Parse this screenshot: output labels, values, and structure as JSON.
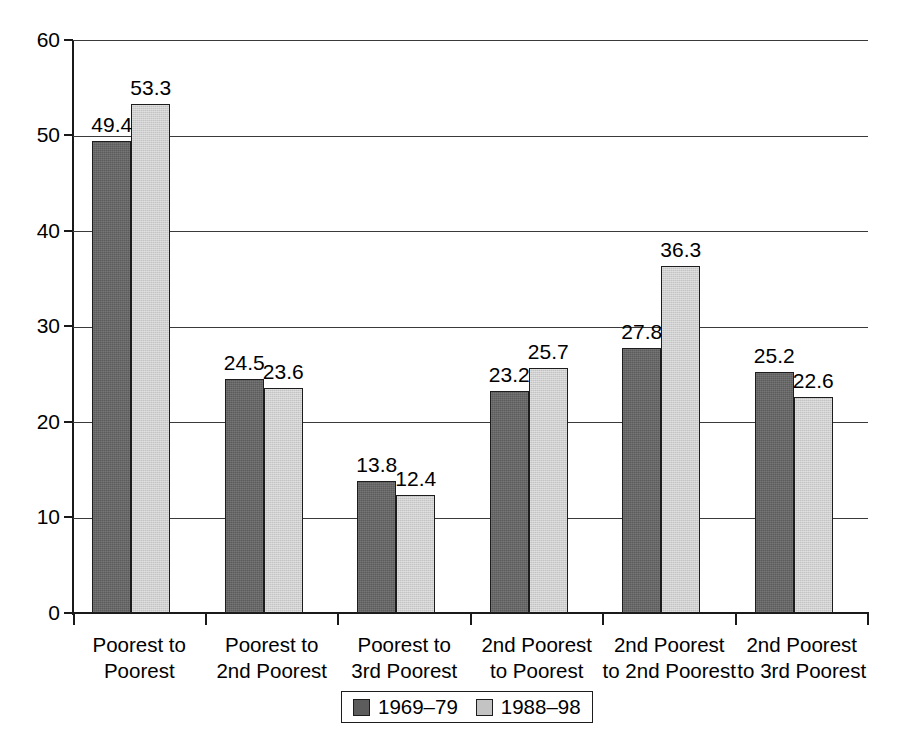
{
  "chart_data": {
    "type": "bar",
    "title": "",
    "subtitle": "",
    "xlabel": "",
    "ylabel": "",
    "ylim": [
      0,
      60
    ],
    "y_ticks": [
      0,
      10,
      20,
      30,
      40,
      50,
      60
    ],
    "grid": true,
    "legend_position": "bottom",
    "categories": [
      "Poorest to Poorest",
      "Poorest to 2nd Poorest",
      "Poorest to 3rd Poorest",
      "2nd Poorest to Poorest",
      "2nd Poorest to 2nd Poorest",
      "2nd Poorest to 3rd Poorest"
    ],
    "category_lines": [
      [
        "Poorest to",
        "Poorest"
      ],
      [
        "Poorest to",
        "2nd Poorest"
      ],
      [
        "Poorest to",
        "3rd Poorest"
      ],
      [
        "2nd Poorest",
        "to Poorest"
      ],
      [
        "2nd Poorest",
        "to 2nd Poorest"
      ],
      [
        "2nd Poorest",
        "to 3rd Poorest"
      ]
    ],
    "series": [
      {
        "name": "1969–79",
        "color": "#5c5c5c",
        "values": [
          49.4,
          24.5,
          13.8,
          23.2,
          27.8,
          25.2
        ]
      },
      {
        "name": "1988–98",
        "color": "#c3c3c3",
        "values": [
          53.3,
          23.6,
          12.4,
          25.7,
          36.3,
          22.6
        ]
      }
    ]
  },
  "axis": {
    "y_tick_labels": [
      "0",
      "10",
      "20",
      "30",
      "40",
      "50",
      "60"
    ]
  },
  "legend": {
    "items": [
      {
        "label": "1969–79",
        "color": "#5c5c5c"
      },
      {
        "label": "1988–98",
        "color": "#c3c3c3"
      }
    ]
  }
}
